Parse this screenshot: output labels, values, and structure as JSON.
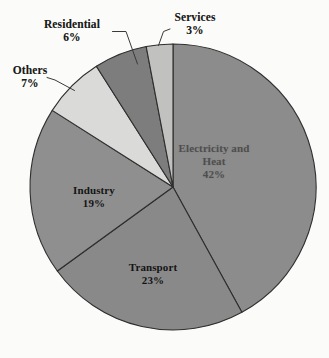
{
  "chart_data": {
    "type": "pie",
    "title": "",
    "subtitle": "",
    "xlabel": "",
    "ylabel": "",
    "legend_position": "none",
    "grid": false,
    "units": "percent",
    "total": 100,
    "start_angle_deg": 0,
    "direction": "clockwise",
    "categories": [
      "Electricity and Heat",
      "Transport",
      "Industry",
      "Others",
      "Residential",
      "Services"
    ],
    "values": [
      42,
      23,
      19,
      7,
      6,
      3
    ],
    "slices": [
      {
        "label": "Electricity and",
        "label_line2": "Heat",
        "name": "Electricity and Heat",
        "value": 42,
        "pct_text": "42%",
        "color": "#8d8d8d",
        "label_placement": "inside",
        "label_style": "faded"
      },
      {
        "label": "Transport",
        "label_line2": "",
        "name": "Transport",
        "value": 23,
        "pct_text": "23%",
        "color": "#8a8a8a",
        "label_placement": "inside",
        "label_style": "dark"
      },
      {
        "label": "Industry",
        "label_line2": "",
        "name": "Industry",
        "value": 19,
        "pct_text": "19%",
        "color": "#909090",
        "label_placement": "inside",
        "label_style": "dark"
      },
      {
        "label": "Others",
        "label_line2": "",
        "name": "Others",
        "value": 7,
        "pct_text": "7%",
        "color": "#dcdcda",
        "label_placement": "outside",
        "label_style": "dark"
      },
      {
        "label": "Residential",
        "label_line2": "",
        "name": "Residential",
        "value": 6,
        "pct_text": "6%",
        "color": "#7e7e7e",
        "label_placement": "outside",
        "label_style": "dark"
      },
      {
        "label": "Services",
        "label_line2": "",
        "name": "Services",
        "value": 3,
        "pct_text": "3%",
        "color": "#c3c3c1",
        "label_placement": "outside",
        "label_style": "dark"
      }
    ],
    "geometry": {
      "center_x": 173,
      "center_y": 187,
      "radius": 143
    },
    "colors": {
      "background": "#fdfdfb",
      "slice_border": "#2e2e2e",
      "leader_line": "#3a3a3a",
      "text": "#191919",
      "text_faded": "#4a4a4a"
    }
  }
}
